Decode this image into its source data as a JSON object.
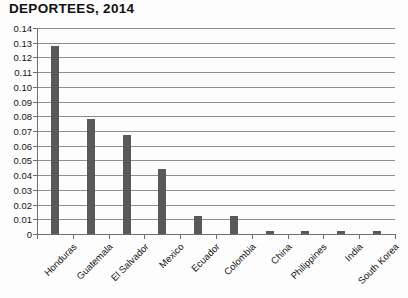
{
  "chart_data": {
    "type": "bar",
    "title": "DEPORTEES, 2014",
    "xlabel": "",
    "ylabel": "",
    "ylim": [
      0,
      0.14
    ],
    "ytick_step": 0.01,
    "grid": true,
    "legend": false,
    "bar_color": "#595959",
    "gridline_color": "#8f8f8f",
    "axis_color": "#6f6f6f",
    "categories": [
      "Honduras",
      "Guatemala",
      "El Salvador",
      "Mexico",
      "Ecuador",
      "Colombia",
      "China",
      "Philippines",
      "India",
      "South Korea"
    ],
    "values": [
      0.128,
      0.078,
      0.067,
      0.044,
      0.012,
      0.012,
      0.002,
      0.002,
      0.002,
      0.002
    ],
    "ytick_labels": [
      "0.14",
      "0.13",
      "0.12",
      "0.11",
      "0.10",
      "0.09",
      "0.08",
      "0.07",
      "0.06",
      "0.05",
      "0.04",
      "0.03",
      "0.02",
      "0.01",
      "0"
    ],
    "ytick_values": [
      0.14,
      0.13,
      0.12,
      0.11,
      0.1,
      0.09,
      0.08,
      0.07,
      0.06,
      0.05,
      0.04,
      0.03,
      0.02,
      0.01,
      0
    ]
  }
}
